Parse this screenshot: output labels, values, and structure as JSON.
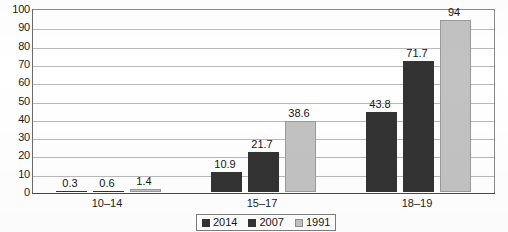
{
  "chart_data": {
    "type": "bar",
    "title": "",
    "subtitle": "",
    "xlabel": "",
    "ylabel": "",
    "categories": [
      "10–14",
      "15–17",
      "18–19"
    ],
    "series": [
      {
        "name": "2014",
        "color": "#333333",
        "values": [
          0.3,
          10.9,
          43.8
        ],
        "labels": [
          "0.3",
          "10.9",
          "43.8"
        ]
      },
      {
        "name": "2007",
        "color": "#333333",
        "values": [
          0.6,
          21.7,
          71.7
        ],
        "labels": [
          "0.6",
          "21.7",
          "71.7"
        ]
      },
      {
        "name": "1991",
        "color": "#c2c2c2",
        "values": [
          1.4,
          38.6,
          94
        ],
        "labels": [
          "1.4",
          "38.6",
          "94"
        ]
      }
    ],
    "ylim": [
      0,
      100
    ],
    "ytick_step": 10,
    "yticks": [
      "100",
      "90",
      "80",
      "70",
      "60",
      "50",
      "40",
      "30",
      "20",
      "10",
      "0"
    ],
    "grid": true,
    "grid_axis": "y",
    "legend": {
      "position": "bottom",
      "entries": [
        {
          "label": "2014",
          "swatch": "dark"
        },
        {
          "label": "2007",
          "swatch": "dark"
        },
        {
          "label": "1991",
          "swatch": "light"
        }
      ]
    }
  }
}
